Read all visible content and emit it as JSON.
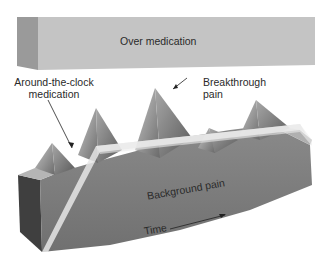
{
  "diagram": {
    "labels": {
      "over_medication": "Over medication",
      "around_the_clock_line1": "Around-the-clock",
      "around_the_clock_line2": "medication",
      "breakthrough_line1": "Breakthrough",
      "breakthrough_line2": "pain",
      "background_pain": "Background pain",
      "time": "Time"
    },
    "colors": {
      "background": "#ffffff",
      "over_medication_front": "#c4c4c4",
      "over_medication_side": "#9a9a9a",
      "block_front": "#7a7a7a",
      "block_side": "#4a4a4a",
      "block_top": "#b0b0b0",
      "medication_band": "#e6e6e6",
      "text": "#2a2a2a"
    }
  }
}
